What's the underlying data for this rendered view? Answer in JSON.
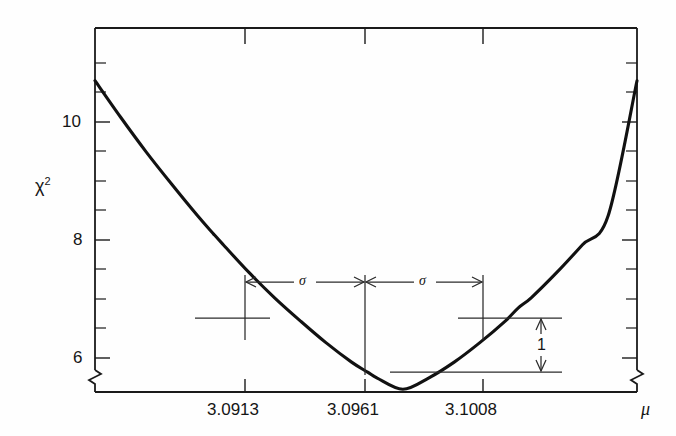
{
  "figure": {
    "background_color": "#fefefe",
    "ink_color": "#111111"
  },
  "axes": {
    "y_axis": {
      "title": "χ",
      "title_superscript": "2",
      "title_full": "χ²",
      "tick_labels": [
        "10",
        "8",
        "6"
      ],
      "tick_values": [
        10,
        8,
        6
      ],
      "minor_tick_step": 0.5,
      "range": [
        5.4,
        11.3
      ],
      "has_axis_break": true
    },
    "x_axis": {
      "title": "μ",
      "tick_labels": [
        "3.0913",
        "3.0961",
        "3.1008"
      ],
      "tick_values": [
        3.0913,
        3.0961,
        3.1008
      ],
      "range": [
        3.0876,
        3.1045
      ],
      "has_axis_break": true
    }
  },
  "annotations": {
    "sigma_left_label": "σ",
    "sigma_right_label": "σ",
    "delta_chi2_label": "1"
  },
  "chart_data": {
    "type": "line",
    "title": "",
    "xlabel": "μ",
    "ylabel": "χ²",
    "xlim": [
      3.0876,
      3.1045
    ],
    "ylim": [
      5.4,
      11.3
    ],
    "grid": false,
    "legend": null,
    "series": [
      {
        "name": "chi-squared parabola",
        "x": [
          3.0876,
          3.0884,
          3.0892,
          3.09,
          3.0908,
          3.0913,
          3.0916,
          3.0924,
          3.0932,
          3.094,
          3.0948,
          3.0956,
          3.0961,
          3.0964,
          3.0972,
          3.098,
          3.0988,
          3.0996,
          3.1004,
          3.1008,
          3.1012,
          3.102,
          3.1028,
          3.1036,
          3.1045
        ],
        "y": [
          10.7,
          10.08,
          9.49,
          8.94,
          8.41,
          8.1,
          7.92,
          7.45,
          7.02,
          6.63,
          6.26,
          5.93,
          5.76,
          5.66,
          5.47,
          5.66,
          5.93,
          6.26,
          6.63,
          6.85,
          7.02,
          7.45,
          7.92,
          8.41,
          10.7
        ]
      }
    ],
    "minimum": {
      "mu": 3.0961,
      "chi2": 5.76
    },
    "one_sigma_points": [
      {
        "mu": 3.0913,
        "chi2": 6.76
      },
      {
        "mu": 3.1008,
        "chi2": 6.76
      }
    ],
    "delta_chi2_interval": 1,
    "sigma_value": 0.0047,
    "annotations": [
      {
        "text": "σ",
        "type": "horizontal-double-arrow",
        "from_mu": 3.0913,
        "to_mu": 3.0961
      },
      {
        "text": "σ",
        "type": "horizontal-double-arrow",
        "from_mu": 3.0961,
        "to_mu": 3.1008
      },
      {
        "text": "1",
        "type": "vertical-double-arrow",
        "from_chi2": 5.76,
        "to_chi2": 6.76
      }
    ]
  }
}
